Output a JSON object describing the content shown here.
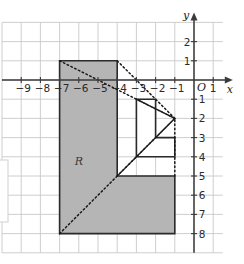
{
  "figure": {
    "background": "#ffffff",
    "grid": {
      "color": "#c8c8c8",
      "x_min": -10,
      "x_max": 1.5,
      "y_min": -9,
      "y_max": 3,
      "step": 1,
      "visible": true
    },
    "axes": {
      "color": "#3a3a3a",
      "x_axis_label": "x",
      "y_axis_label": "y",
      "origin_label": "O",
      "x_tick_labels": [
        "−9",
        "−8",
        "−7",
        "−6",
        "−5",
        "−4",
        "−3",
        "−2",
        "−1",
        "1"
      ],
      "x_tick_values": [
        -9,
        -8,
        -7,
        -6,
        -5,
        -4,
        -3,
        -2,
        -1,
        1
      ],
      "y_tick_labels_positive": [
        "2",
        "1"
      ],
      "y_tick_values_positive": [
        2,
        1
      ],
      "y_tick_labels_negative": [
        "1",
        "2",
        "3",
        "4",
        "5",
        "6",
        "7",
        "8"
      ],
      "y_tick_values_negative": [
        -1,
        -2,
        -3,
        -4,
        -5,
        -6,
        -7,
        -8
      ]
    },
    "shapes": [
      {
        "name": "region-r",
        "label": "R",
        "label_x": -6,
        "label_y": -4.45,
        "fill": "#b5b5b5",
        "stroke": "#2a2a2a",
        "stroke_width": 1.6,
        "points": [
          [
            -7,
            1
          ],
          [
            -4,
            1
          ],
          [
            -4,
            -5
          ],
          [
            -1,
            -5
          ],
          [
            -1,
            -8
          ],
          [
            -7,
            -8
          ]
        ]
      },
      {
        "name": "image-shape",
        "label": "",
        "fill": "#ffffff",
        "stroke": "#2a2a2a",
        "stroke_width": 1.6,
        "points": [
          [
            -3,
            -1
          ],
          [
            -2,
            -1
          ],
          [
            -2,
            -3
          ],
          [
            -1,
            -3
          ],
          [
            -1,
            -4
          ],
          [
            -3,
            -4
          ]
        ]
      }
    ],
    "center_of_enlargement": {
      "x": -1,
      "y": -2,
      "name": "center-of-enlargement"
    },
    "rays": {
      "color": "#1a1a1a",
      "style": "dotted",
      "dash": "1.6 2.6",
      "width": 1.5,
      "lines": [
        [
          [
            -7,
            1
          ],
          [
            -1,
            -2
          ]
        ],
        [
          [
            -4,
            1
          ],
          [
            -1,
            -2
          ]
        ],
        [
          [
            -4,
            -5
          ],
          [
            -1,
            -2
          ]
        ],
        [
          [
            -7,
            -8
          ],
          [
            -1,
            -2
          ]
        ],
        [
          [
            -1,
            -5
          ],
          [
            -1,
            -2
          ]
        ],
        [
          [
            -3,
            -1
          ],
          [
            -1,
            -2
          ]
        ]
      ]
    },
    "side_box": {
      "name": "cropped-side-box",
      "color": "#d8d8d8"
    }
  }
}
